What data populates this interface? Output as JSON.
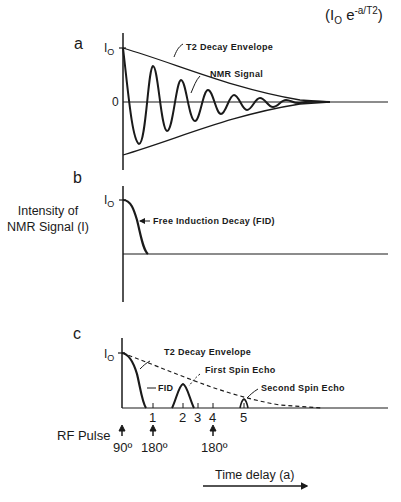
{
  "formula": {
    "base": "I",
    "sub": "O",
    "e": "e",
    "exp": "-a/T2"
  },
  "y_axis_label": [
    "Intensity of",
    "NMR Signal (I)"
  ],
  "panels": {
    "a": {
      "label": "a",
      "io_label": "I",
      "io_sub": "O",
      "zero_label": "0",
      "annotations": {
        "envelope": "T2 Decay Envelope",
        "signal": "NMR Signal"
      }
    },
    "b": {
      "label": "b",
      "io_label": "I",
      "io_sub": "O",
      "annotations": {
        "fid": "Free Induction Decay (FID)"
      }
    },
    "c": {
      "label": "c",
      "io_label": "I",
      "io_sub": "O",
      "annotations": {
        "envelope": "T2 Decay Envelope",
        "fid": "FID",
        "first_echo": "First Spin Echo",
        "second_echo": "Second Spin Echo"
      },
      "ticks": [
        "1",
        "2",
        "3",
        "4",
        "5"
      ]
    }
  },
  "rf_pulse": {
    "label": "RF Pulse",
    "pulses": [
      {
        "angle": "90º"
      },
      {
        "angle": "180º"
      },
      {
        "angle": "180º"
      }
    ]
  },
  "time_axis": {
    "label": "Time delay (a)"
  },
  "colors": {
    "ink": "#1a1a1a",
    "background": "#ffffff"
  }
}
